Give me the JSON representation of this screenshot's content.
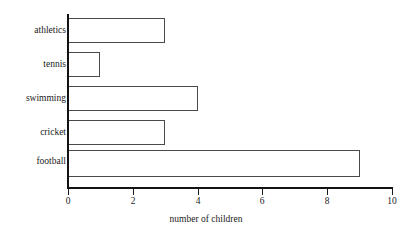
{
  "chart_data": {
    "type": "bar",
    "orientation": "horizontal",
    "title": "",
    "subtitle": "",
    "xlabel": "number of children",
    "ylabel": "",
    "categories": [
      "athletics",
      "tennis",
      "swimming",
      "cricket",
      "football"
    ],
    "values": [
      3,
      1,
      4,
      3,
      9
    ],
    "series": [
      {
        "name": "number of children",
        "values": [
          3,
          1,
          4,
          3,
          9
        ]
      }
    ],
    "xlim": [
      0,
      10
    ],
    "xticks": [
      0,
      2,
      4,
      6,
      8,
      10
    ],
    "xticklabels": [
      "0",
      "2",
      "4",
      "6",
      "8",
      "10"
    ],
    "grid": false,
    "legend": false,
    "legend_position": "none",
    "bar_fill_color": "#ffffff",
    "bar_edge_color": "#4a4a4a",
    "axis_color": "#121212",
    "text_color": "#1a1a1a",
    "background_color": "#ffffff"
  },
  "axis": {
    "x_title": "number of children",
    "ticks": [
      {
        "value": "0"
      },
      {
        "value": "2"
      },
      {
        "value": "4"
      },
      {
        "value": "6"
      },
      {
        "value": "8"
      },
      {
        "value": "10"
      }
    ]
  },
  "bars": [
    {
      "label": "athletics",
      "value": 3
    },
    {
      "label": "tennis",
      "value": 1
    },
    {
      "label": "swimming",
      "value": 4
    },
    {
      "label": "cricket",
      "value": 3
    },
    {
      "label": "football",
      "value": 9
    }
  ]
}
